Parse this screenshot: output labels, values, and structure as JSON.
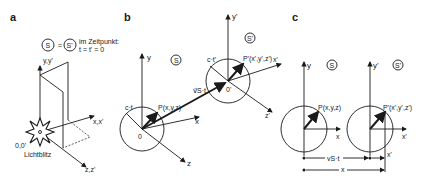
{
  "panels": {
    "a": {
      "label": "a",
      "frame_s": "S",
      "frame_s_prime": "S'",
      "equals": "=",
      "caption_line1": "im Zeitpunkt:",
      "caption_line2": "t = t' = 0",
      "axis_y": "y,y'",
      "axis_x": "x,x'",
      "axis_z": "z,z'",
      "origin": "0,0'",
      "flash": "Lichtblitz"
    },
    "b": {
      "label": "b",
      "frame_s": "S",
      "frame_s_prime": "S'",
      "axis_y": "y",
      "axis_x": "x",
      "axis_z": "z",
      "axis_y_prime": "y'",
      "axis_x_prime": "x'",
      "axis_z_prime": "z'",
      "origin": "0",
      "origin_prime": "0'",
      "radius": "c·t",
      "radius_prime": "c·t'",
      "point": "P(x,y,z)",
      "point_prime": "P'(x',y',z')",
      "velocity": "v⃗S·t"
    },
    "c": {
      "label": "c",
      "frame_s": "S",
      "frame_s_prime": "S'",
      "axis_y": "y",
      "axis_x": "x",
      "axis_y_prime": "y'",
      "axis_x_prime": "x'",
      "point": "P(x,y,z)",
      "point_prime": "P'(x',y',z')",
      "dim_vst": "vS·t",
      "dim_x_prime": "x'",
      "dim_x": "x"
    }
  },
  "colors": {
    "ink": "#1a1a1a",
    "background": "#ffffff"
  }
}
